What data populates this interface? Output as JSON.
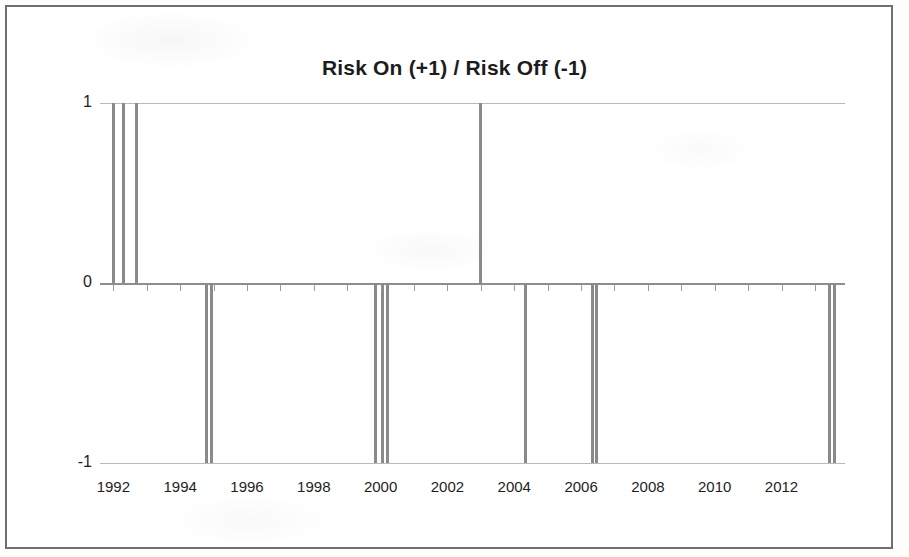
{
  "chart_data": {
    "type": "bar",
    "title": "Risk On (+1) / Risk Off (-1)",
    "xlabel": "",
    "ylabel": "",
    "ylim": [
      -1,
      1
    ],
    "yticks": [
      "1",
      "0",
      "-1"
    ],
    "ytick_values": [
      1,
      0,
      -1
    ],
    "xlim": [
      1991.6,
      2013.9
    ],
    "xtick_labels": [
      "1992",
      "1994",
      "1996",
      "1998",
      "2000",
      "2002",
      "2004",
      "2006",
      "2008",
      "2010",
      "2012"
    ],
    "xtick_values": [
      1992,
      1994,
      1996,
      1998,
      2000,
      2002,
      2004,
      2006,
      2008,
      2010,
      2012
    ],
    "grid": true,
    "legend": null,
    "series": [
      {
        "name": "Risk On / Risk Off",
        "color": "#8a8a8a",
        "x": [
          1992.0,
          1992.3,
          1992.7,
          1994.8,
          1994.95,
          1999.85,
          2000.05,
          2000.2,
          2003.0,
          2004.35,
          2006.35,
          2006.45,
          2013.45,
          2013.6
        ],
        "values": [
          1,
          1,
          1,
          -1,
          -1,
          -1,
          -1,
          -1,
          1,
          -1,
          -1,
          -1,
          -1,
          -1
        ]
      }
    ]
  },
  "axis": {
    "zero_line_color": "#8e8e8e",
    "grid_color": "#b9b9b9",
    "tick_color": "#9a9a9a"
  },
  "frame": {
    "border_color": "#6e6e6e",
    "background": "#ffffff"
  }
}
